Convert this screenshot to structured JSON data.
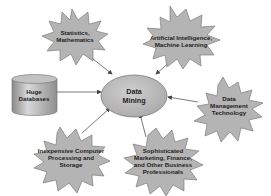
{
  "diagram": {
    "center": {
      "id": "data-mining",
      "lines": [
        "Data",
        "Mining"
      ],
      "shape": "ellipse"
    },
    "nodes": [
      {
        "id": "statistics",
        "lines": [
          "Statistics,",
          "Mathematics"
        ],
        "shape": "starburst"
      },
      {
        "id": "ai",
        "lines": [
          "Artificial Intelligence,",
          "Machine Learning"
        ],
        "shape": "starburst"
      },
      {
        "id": "databases",
        "lines": [
          "Huge",
          "Databases"
        ],
        "shape": "cylinder"
      },
      {
        "id": "data-mgmt",
        "lines": [
          "Data",
          "Management",
          "Technology"
        ],
        "shape": "starburst"
      },
      {
        "id": "computing",
        "lines": [
          "Inexpensive Computer",
          "Processing and",
          "Storage"
        ],
        "shape": "starburst"
      },
      {
        "id": "business",
        "lines": [
          "Sophisticated",
          "Marketing, Finance,",
          "and Other Business",
          "Professionals"
        ],
        "shape": "starburst"
      }
    ],
    "edges": [
      {
        "from": "statistics",
        "to": "data-mining"
      },
      {
        "from": "ai",
        "to": "data-mining"
      },
      {
        "from": "databases",
        "to": "data-mining"
      },
      {
        "from": "data-mgmt",
        "to": "data-mining"
      },
      {
        "from": "computing",
        "to": "data-mining"
      },
      {
        "from": "business",
        "to": "data-mining"
      }
    ],
    "colors": {
      "shape_fill": "#b4b4b4",
      "shape_stroke": "#6e6e6e",
      "text": "#1e1e1e",
      "arrow": "#555555",
      "background": "#ffffff"
    }
  }
}
